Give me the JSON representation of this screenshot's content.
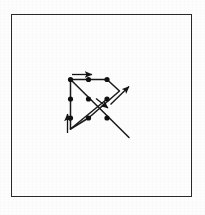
{
  "figure": {
    "title": "",
    "caption": "",
    "background_color": "#fdfdfd",
    "frame": {
      "name": "outer-border",
      "stroke_color": "#2a2a2a",
      "stroke_width": 1.6,
      "x": 11,
      "y": 14,
      "width": 181,
      "height": 183
    },
    "diagram": {
      "type": "node-link-graph",
      "stroke_color": "#1a1a1a",
      "node_color": "#111111",
      "node_radius": 2.6,
      "nodes": [
        {
          "id": "n1",
          "label": "",
          "x": 70.5,
          "y": 79.5,
          "row": 0,
          "col": 0
        },
        {
          "id": "n2",
          "label": "",
          "x": 88.5,
          "y": 79.5,
          "row": 0,
          "col": 1
        },
        {
          "id": "n3",
          "label": "",
          "x": 107.0,
          "y": 79.5,
          "row": 0,
          "col": 2
        },
        {
          "id": "n4",
          "label": "",
          "x": 70.5,
          "y": 99.0,
          "row": 1,
          "col": 0
        },
        {
          "id": "n5",
          "label": "",
          "x": 88.5,
          "y": 99.0,
          "row": 1,
          "col": 1
        },
        {
          "id": "n6",
          "label": "",
          "x": 107.0,
          "y": 99.0,
          "row": 1,
          "col": 2
        },
        {
          "id": "n7",
          "label": "",
          "x": 70.5,
          "y": 118.0,
          "row": 2,
          "col": 0
        },
        {
          "id": "n8",
          "label": "",
          "x": 88.5,
          "y": 118.0,
          "row": 2,
          "col": 1
        },
        {
          "id": "n9",
          "label": "",
          "x": 107.0,
          "y": 118.0,
          "row": 2,
          "col": 2
        }
      ],
      "edges": [
        {
          "id": "e1",
          "from": "n1",
          "to": "n3",
          "kind": "horizontal-top"
        },
        {
          "id": "e2",
          "from": "n1",
          "to": "n7",
          "kind": "vertical-left"
        },
        {
          "id": "e3",
          "from": "n1",
          "to": "n9",
          "kind": "diagonal-down-right"
        },
        {
          "id": "e4",
          "from": "n3",
          "to": "n7",
          "kind": "diagonal-down-left"
        },
        {
          "id": "e5",
          "from": "n7",
          "to": "n3",
          "kind": "chevron-lower-left"
        }
      ],
      "polylines": [
        {
          "id": "p1",
          "name": "upper-chevron",
          "points": "70.5,79.5 107.0,79.5 118.5,91.5 88.5,118.0"
        },
        {
          "id": "p2",
          "name": "lower-chevron",
          "points": "70.5,79.5 70.5,79.5 70.5,128.5 88.5,118.0"
        },
        {
          "id": "p3",
          "name": "diagonal-ray",
          "points": "70.5,79.5 128.5,137.0"
        },
        {
          "id": "p4",
          "name": "left-vertical",
          "points": "70.5,79.5 70.5,128.5"
        }
      ],
      "arrows": [
        {
          "id": "a1",
          "name": "arrow-right-top",
          "direction": "right",
          "x1": 72.0,
          "y1": 74.5,
          "x2": 92.0,
          "y2": 74.5
        },
        {
          "id": "a2",
          "name": "arrow-up-left",
          "direction": "up",
          "x1": 67.5,
          "y1": 133.0,
          "x2": 67.5,
          "y2": 114.0
        },
        {
          "id": "a3",
          "name": "arrow-northeast-right",
          "direction": "up-right",
          "x1": 110.5,
          "y1": 104.5,
          "x2": 129.0,
          "y2": 86.5
        },
        {
          "id": "a4",
          "name": "arrow-southeast-middle",
          "direction": "down-right",
          "x1": 96.0,
          "y1": 98.5,
          "x2": 108.0,
          "y2": 108.0
        }
      ]
    }
  }
}
